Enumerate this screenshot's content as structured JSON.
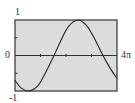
{
  "chart_data": {
    "type": "line",
    "title": "",
    "xlabel": "",
    "ylabel": "",
    "xlim": [
      0,
      12.566
    ],
    "ylim": [
      -1,
      1
    ],
    "x_tick_labels": {
      "left": "0",
      "right": "4π"
    },
    "y_tick_labels": {
      "top": "1",
      "bottom": "-1"
    },
    "x_ticks_units_of_pi": [
      1,
      2,
      3
    ],
    "y_ticks": [
      -0.5,
      0.5
    ],
    "grid": false,
    "background": "#dcdcdc",
    "line_color": "#222222",
    "series": [
      {
        "name": "curve",
        "x_units_of_pi": [
          0,
          0.25,
          0.55,
          0.9,
          1.2,
          1.53,
          1.8,
          2.1,
          2.47,
          2.8,
          3.1,
          3.45,
          3.7,
          4.0
        ],
        "y": [
          -0.7,
          -0.92,
          -1.0,
          -0.85,
          -0.48,
          0.0,
          0.42,
          0.82,
          1.0,
          0.85,
          0.5,
          0.0,
          -0.32,
          -0.65
        ]
      }
    ]
  }
}
